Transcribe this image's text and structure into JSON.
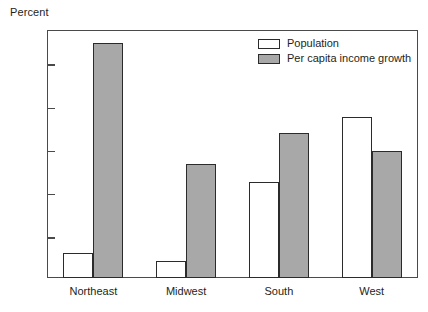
{
  "chart_data": {
    "type": "bar",
    "title": "",
    "xlabel": "",
    "ylabel": "Percent",
    "categories": [
      "Northeast",
      "Midwest",
      "South",
      "West"
    ],
    "series": [
      {
        "name": "Population",
        "color": "#ffffff",
        "values": [
          0.033,
          0.023,
          0.115,
          0.19
        ]
      },
      {
        "name": "Per capita income growth",
        "color": "#a8a8a8",
        "values": [
          0.275,
          0.135,
          0.171,
          0.151
        ]
      }
    ],
    "yticks": [
      0.05,
      0.1,
      0.15,
      0.2,
      0.25
    ],
    "ytick_labels": [
      "0.05",
      "0.1",
      "0.15",
      "0.2",
      "0.25"
    ],
    "ylim": [
      0.0036,
      0.2905
    ],
    "grid": false,
    "legend_position": "top-right",
    "frame": true
  },
  "axis": {
    "y_title": "Percent"
  },
  "legend": {
    "entries": [
      {
        "label": "Population"
      },
      {
        "label": "Per capita income growth"
      }
    ]
  }
}
